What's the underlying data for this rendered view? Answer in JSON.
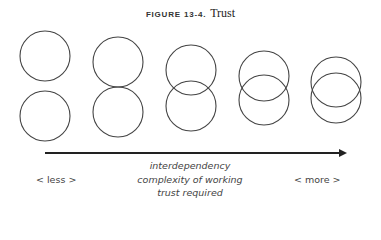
{
  "title": {
    "figure_label": "FIGURE 13-4.",
    "name": "Trust"
  },
  "diagram": {
    "circle_pairs": [
      {
        "cx": 45,
        "top_cy": 56,
        "bottom_cy": 116,
        "r": 25
      },
      {
        "cx": 118,
        "top_cy": 62,
        "bottom_cy": 112,
        "r": 25
      },
      {
        "cx": 191,
        "top_cy": 70,
        "bottom_cy": 106,
        "r": 25
      },
      {
        "cx": 264,
        "top_cy": 76,
        "bottom_cy": 100,
        "r": 25
      },
      {
        "cx": 336,
        "top_cy": 82,
        "bottom_cy": 98,
        "r": 25
      }
    ],
    "stroke_color": "#444444",
    "arrow": {
      "x1": 45,
      "x2": 347,
      "y": 153,
      "color": "#222222"
    }
  },
  "axis_labels": {
    "left": "< less >",
    "right": "< more >",
    "center_lines": [
      "interdependency",
      "complexity of working",
      "trust required"
    ]
  }
}
